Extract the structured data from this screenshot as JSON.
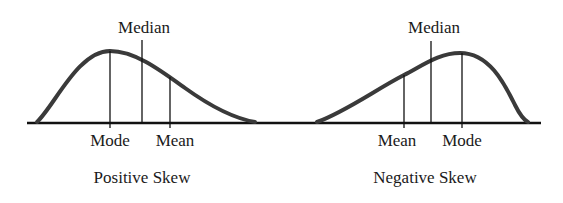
{
  "diagram": {
    "panels": [
      {
        "id": "positive",
        "caption": "Positive Skew",
        "labels": {
          "median": "Median",
          "mode": "Mode",
          "mean": "Mean"
        },
        "order_left_to_right": [
          "Mode",
          "Median",
          "Mean"
        ]
      },
      {
        "id": "negative",
        "caption": "Negative Skew",
        "labels": {
          "median": "Median",
          "mode": "Mode",
          "mean": "Mean"
        },
        "order_left_to_right": [
          "Mean",
          "Median",
          "Mode"
        ]
      }
    ],
    "colors": {
      "curve": "#3a3a3a",
      "axis": "#111111",
      "text": "#1a1a1a",
      "background": "#ffffff"
    }
  }
}
